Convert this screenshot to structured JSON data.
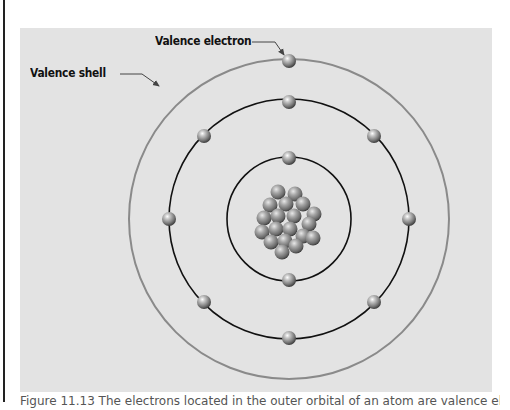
{
  "figure": {
    "labels": {
      "valence_electron": "Valence electron",
      "valence_shell": "Valence shell"
    },
    "caption": "Figure 11.13 The electrons located in the outer orbital of an atom are valence electrons.",
    "colors": {
      "panel_background": "#e3e3e3",
      "outer_shell": "#8a8a8a",
      "inner_shells": "#111111",
      "electron": "#888888"
    },
    "atom": {
      "center": [
        269,
        191
      ],
      "shells": [
        {
          "name": "inner-shell",
          "radius": 62,
          "electrons": 2
        },
        {
          "name": "middle-shell",
          "radius": 120,
          "electrons": 8
        },
        {
          "name": "valence-shell",
          "radius": 160,
          "electrons": 2
        }
      ],
      "nucleus_particles": 26
    }
  }
}
